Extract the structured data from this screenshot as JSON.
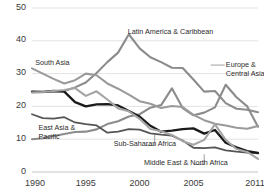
{
  "chart_data": {
    "type": "line",
    "title": "",
    "subtitle": "",
    "xlabel": "",
    "ylabel": "",
    "xlim": [
      1990,
      2011
    ],
    "ylim": [
      0,
      50
    ],
    "grid": true,
    "legend_position": "inline-labels",
    "x": [
      1990,
      1991,
      1992,
      1993,
      1994,
      1995,
      1996,
      1997,
      1998,
      1999,
      2000,
      2001,
      2002,
      2003,
      2004,
      2005,
      2006,
      2007,
      2008,
      2009,
      2010,
      2011
    ],
    "yticks": [
      0,
      10,
      20,
      30,
      40,
      50
    ],
    "ytick_labels": [
      "0",
      "10",
      "20",
      "30",
      "40",
      "50"
    ],
    "xticks": [
      1990,
      1995,
      2000,
      2005,
      2011
    ],
    "xtick_labels": [
      "1990",
      "1995",
      "2000",
      "2005",
      "2011"
    ],
    "series": [
      {
        "name": "Latin America & Caribbean",
        "color": "#8c8c8c",
        "width": 2.1,
        "label_x": 1998.9,
        "label_y": 42.4,
        "values": [
          24.4,
          24.3,
          24.6,
          24.7,
          25.8,
          27.3,
          30.2,
          33.5,
          36.4,
          42.0,
          37.7,
          35.0,
          33.5,
          31.8,
          31.7,
          28.2,
          24.5,
          24.7,
          21.0,
          19.3,
          19.0,
          18.2
        ]
      },
      {
        "name": "Europe & Central Asia",
        "color": "#8c8c8c",
        "width": 2.1,
        "label_x": 2008.2,
        "label_y": 32.2,
        "values": [
          10.0,
          10.3,
          11.0,
          11.6,
          12.2,
          12.3,
          13.0,
          14.6,
          15.5,
          16.9,
          17.6,
          19.6,
          20.4,
          25.5,
          19.5,
          17.3,
          18.1,
          19.7,
          26.6,
          22.8,
          20.0,
          13.8
        ]
      },
      {
        "name": "South Asia",
        "color": "#9a9a9a",
        "width": 2.1,
        "label_x": 1990.3,
        "label_y": 33.0,
        "values": [
          31.6,
          30.0,
          28.4,
          27.0,
          28.0,
          30.0,
          29.5,
          27.0,
          25.4,
          23.6,
          21.6,
          20.8,
          19.5,
          20.1,
          19.8,
          17.4,
          15.8,
          14.7,
          14.2,
          13.5,
          13.2,
          14.0
        ]
      },
      {
        "name": "East Asia & Pacific",
        "color": "#555555",
        "width": 1.8,
        "label_x": 1990.6,
        "label_y": 13.0,
        "values": [
          17.6,
          16.4,
          16.3,
          16.7,
          15.1,
          14.6,
          14.2,
          12.0,
          12.3,
          13.1,
          12.9,
          11.8,
          11.4,
          11.1,
          9.6,
          7.4,
          7.3,
          7.5,
          6.6,
          6.2,
          5.9,
          5.7
        ]
      },
      {
        "name": "Sub-Saharan Africa",
        "color": "#1a1a1a",
        "width": 2.3,
        "label_x": 1997.6,
        "label_y": 8.1,
        "values": [
          24.5,
          24.4,
          24.7,
          24.5,
          21.3,
          20.0,
          20.6,
          20.7,
          20.3,
          18.6,
          16.9,
          14.1,
          12.3,
          12.6,
          13.1,
          13.3,
          11.7,
          12.8,
          8.9,
          7.5,
          6.4,
          5.8
        ]
      },
      {
        "name": "Middle East & North Africa",
        "color": "#a5a5a5",
        "width": 2.1,
        "label_x": 2000.4,
        "label_y": 2.3,
        "values": [
          24.2,
          24.4,
          24.7,
          25.0,
          25.6,
          23.2,
          24.6,
          22.1,
          19.4,
          18.5,
          16.2,
          13.1,
          12.4,
          11.3,
          9.4,
          8.3,
          9.8,
          14.5,
          9.8,
          7.0,
          6.1,
          4.0
        ]
      }
    ],
    "leader_lines": [
      {
        "name": "sub-saharan-africa-leader",
        "x1": 2000.55,
        "y1": 8.1,
        "x2": 2001.4,
        "y2": 8.1,
        "x3": 2001.4,
        "y3": 11.6
      },
      {
        "name": "middle-east-north-africa-leader",
        "x1": 2005.1,
        "y1": 2.3,
        "x2": 2006.0,
        "y2": 2.3,
        "x3": 2006.0,
        "y3": 5.4
      },
      {
        "name": "europe-central-asia-leader",
        "x1": 2006.6,
        "y1": 32.6,
        "x2": 2007.9,
        "y2": 32.6
      }
    ],
    "axis_color": "#bdbdbd",
    "grid_color": "#d7d7d7",
    "background": "#ffffff"
  }
}
